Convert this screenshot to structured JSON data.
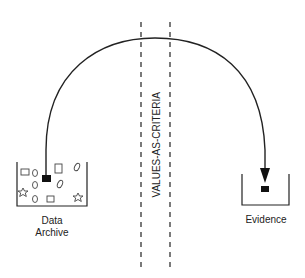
{
  "diagram": {
    "divider_label": "VALUES-AS-CRITERIA",
    "source": {
      "label_line1": "Data",
      "label_line2": "Archive",
      "icon": "container-with-mixed-shapes"
    },
    "target": {
      "label": "Evidence",
      "icon": "container-with-selected-item"
    },
    "connector": {
      "type": "curved-arrow",
      "from": "Data Archive",
      "to": "Evidence"
    },
    "colors": {
      "line": "#222222",
      "fill": "#111111",
      "background": "#ffffff"
    }
  }
}
